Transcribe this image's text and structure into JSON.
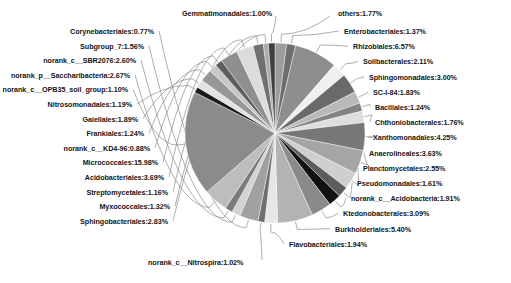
{
  "chart_data": {
    "type": "pie",
    "title": "",
    "legend_position": "labels-with-leader-lines",
    "units": "percent",
    "categories": [
      "others",
      "Enterobacteriales",
      "Rhizobiales",
      "Solibacterales",
      "Sphingomonadales",
      "SC-I-84",
      "Bacillales",
      "Chthoniobacterales",
      "Xanthomonadales",
      "Anaerolineales",
      "Planctomycetales",
      "Pseudomonadales",
      "norank_c__Acidobacteria",
      "Ktedonobacterales",
      "Burkholderiales",
      "Flavobacteriales",
      "norank_c__Nitrospira",
      "Sphingobacteriales",
      "Myxococcales",
      "Streptomycetales",
      "Acidobacteriales",
      "Micrococcales",
      "norank_c__KD4-96",
      "Frankiales",
      "Gaiellales",
      "Nitrosomonadales",
      "norank_c__OPB35_soil_group",
      "norank_p__Saccharibacteria",
      "norank_c__SBR2076",
      "Subgroup_7",
      "Corynebacteriales",
      "Gemmatimonadales"
    ],
    "values": [
      1.77,
      1.37,
      6.57,
      2.11,
      3.0,
      1.83,
      1.24,
      1.76,
      4.25,
      3.63,
      2.55,
      1.61,
      1.91,
      3.09,
      5.4,
      1.94,
      1.02,
      2.83,
      1.32,
      1.16,
      3.69,
      15.98,
      0.88,
      1.24,
      1.89,
      1.19,
      1.1,
      2.67,
      2.6,
      1.56,
      0.77,
      1.0
    ],
    "slice_colors": [
      "#9d9d9d",
      "#6d6d6d",
      "#8e8e8e",
      "#f0f0f0",
      "#6a6a6a",
      "#b9b9b9",
      "#838383",
      "#dedede",
      "#777777",
      "#a5a5a5",
      "#cfcfcf",
      "#5c5c5c",
      "#111111",
      "#8a8a8a",
      "#b3b3b3",
      "#e6e6e6",
      "#6f6f6f",
      "#a0a0a0",
      "#d2d2d2",
      "#7b7b7b",
      "#bdbdbd",
      "#8b8b8b",
      "#1d1d1d",
      "#e2e2e2",
      "#979797",
      "#c8c8c8",
      "#5f5f5f",
      "#8f8f8f",
      "#dcdcdc",
      "#707070",
      "#ababab",
      "#404040"
    ],
    "leader_line_color": "#8d8d8d",
    "label_color": "#151515"
  },
  "labels": {
    "top_left": {
      "text": "Gemmatimonadales:1.00%"
    },
    "top_right": {
      "text": "others:1.77%"
    },
    "right": [
      {
        "text": "Enterobacteriales:1.37%"
      },
      {
        "text": "Rhizobiales:6.57%"
      },
      {
        "text": "Solibacterales:2.11%"
      },
      {
        "text": "Sphingomonadales:3.00%"
      },
      {
        "text": "SC-I-84:1.83%"
      },
      {
        "text": "Bacillales:1.24%"
      },
      {
        "text": "Chthoniobacterales:1.76%"
      },
      {
        "text": "Xanthomonadales:4.25%"
      },
      {
        "text": "Anaerolineales:3.63%"
      },
      {
        "text": "Planctomycetales:2.55%"
      },
      {
        "text": "Pseudomonadales:1.61%"
      },
      {
        "text": "norank_c__Acidobacteria:1.91%"
      },
      {
        "text": "Ktedonobacterales:3.09%"
      },
      {
        "text": "Burkholderiales:5.40%"
      },
      {
        "text": "Flavobacteriales:1.94%"
      }
    ],
    "left": [
      {
        "text": "Corynebacteriales:0.77%"
      },
      {
        "text": "Subgroup_7:1.56%"
      },
      {
        "text": "norank_c__SBR2076:2.60%"
      },
      {
        "text": "norank_p__Saccharibacteria:2.67%"
      },
      {
        "text": "norank_c__OPB35_soil_group:1.10%"
      },
      {
        "text": "Nitrosomonadales:1.19%"
      },
      {
        "text": "Gaiellales:1.89%"
      },
      {
        "text": "Frankiales:1.24%"
      },
      {
        "text": "norank_c__KD4-96:0.88%"
      },
      {
        "text": "Micrococcales:15.98%"
      },
      {
        "text": "Acidobacteriales:3.69%"
      },
      {
        "text": "Streptomycetales:1.16%"
      },
      {
        "text": "Myxococcales:1.32%"
      },
      {
        "text": "Sphingobacteriales:2.83%"
      }
    ],
    "bottom": [
      {
        "text": "norank_c__Nitrospira:1.02%"
      }
    ]
  }
}
